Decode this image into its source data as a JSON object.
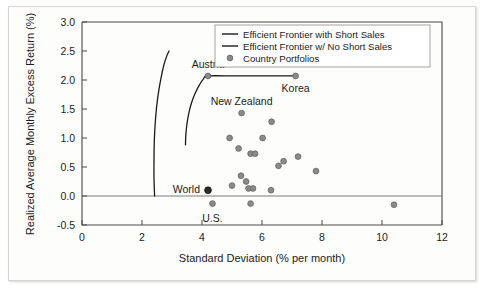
{
  "chart_data": {
    "type": "scatter",
    "title": "",
    "xlabel": "Standard Deviation (% per month)",
    "ylabel": "Realized Average Monthly Excess Return (%)",
    "xlim": [
      0,
      12
    ],
    "ylim": [
      -0.5,
      3.0
    ],
    "xticks": [
      0,
      2,
      4,
      6,
      8,
      10,
      12
    ],
    "yticks": [
      -0.5,
      0.0,
      0.5,
      1.0,
      1.5,
      2.0,
      2.5,
      3.0
    ],
    "xtick_labels": [
      "0",
      "2",
      "4",
      "6",
      "8",
      "10",
      "12"
    ],
    "ytick_labels": [
      "-0.5",
      "0.0",
      "0.5",
      "1.0",
      "1.5",
      "2.0",
      "2.5",
      "3.0"
    ],
    "grid": false,
    "legend_position": "top-right",
    "legend": [
      {
        "label": "Efficient Frontier with Short Sales",
        "marker": "line"
      },
      {
        "label": "Efficient Frontier w/ No Short Sales",
        "marker": "line"
      },
      {
        "label": "Country Portfolios",
        "marker": "dot"
      }
    ],
    "series": [
      {
        "name": "Efficient Frontier with Short Sales",
        "type": "line",
        "points": [
          [
            2.42,
            0.0
          ],
          [
            2.4,
            0.3
          ],
          [
            2.4,
            0.62
          ],
          [
            2.41,
            0.95
          ],
          [
            2.44,
            1.25
          ],
          [
            2.49,
            1.55
          ],
          [
            2.56,
            1.82
          ],
          [
            2.64,
            2.05
          ],
          [
            2.73,
            2.26
          ],
          [
            2.83,
            2.42
          ],
          [
            2.9,
            2.5
          ]
        ]
      },
      {
        "name": "Efficient Frontier w/ No Short Sales",
        "type": "line",
        "points": [
          [
            3.45,
            0.88
          ],
          [
            3.46,
            1.05
          ],
          [
            3.5,
            1.25
          ],
          [
            3.57,
            1.45
          ],
          [
            3.66,
            1.62
          ],
          [
            3.78,
            1.78
          ],
          [
            3.92,
            1.92
          ],
          [
            4.05,
            2.02
          ],
          [
            4.2,
            2.07
          ],
          [
            5.1,
            2.07
          ],
          [
            6.1,
            2.07
          ],
          [
            7.12,
            2.07
          ]
        ]
      },
      {
        "name": "Country Portfolios",
        "type": "scatter",
        "points": [
          [
            4.2,
            2.07
          ],
          [
            7.12,
            2.07
          ],
          [
            5.32,
            1.43
          ],
          [
            6.32,
            1.28
          ],
          [
            4.92,
            1.0
          ],
          [
            6.02,
            1.0
          ],
          [
            5.22,
            0.82
          ],
          [
            5.62,
            0.73
          ],
          [
            5.77,
            0.73
          ],
          [
            6.72,
            0.6
          ],
          [
            6.55,
            0.52
          ],
          [
            7.2,
            0.68
          ],
          [
            7.8,
            0.43
          ],
          [
            5.3,
            0.35
          ],
          [
            5.47,
            0.25
          ],
          [
            5.0,
            0.18
          ],
          [
            5.55,
            0.13
          ],
          [
            5.7,
            0.13
          ],
          [
            4.2,
            0.1
          ],
          [
            6.3,
            0.1
          ],
          [
            4.35,
            -0.13
          ],
          [
            5.62,
            -0.13
          ],
          [
            10.4,
            -0.15
          ]
        ]
      }
    ],
    "annotations": [
      {
        "text": "Austria",
        "x": 4.2,
        "y": 2.07
      },
      {
        "text": "Korea",
        "x": 7.12,
        "y": 2.07
      },
      {
        "text": "New Zealand",
        "x": 5.32,
        "y": 1.43
      },
      {
        "text": "World",
        "x": 4.2,
        "y": 0.1
      },
      {
        "text": "U.S.",
        "x": 4.35,
        "y": -0.13
      }
    ],
    "colors": {
      "marker": "#8a8a8a",
      "marker_highlight": "#2a2a2a",
      "line": "#1a1a1a",
      "axis": "#4a4a4a",
      "background": "#fdfdfc"
    }
  }
}
